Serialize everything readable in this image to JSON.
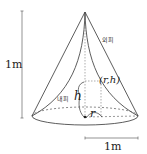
{
  "diagram": {
    "labels": {
      "height_dimension": "1m",
      "width_dimension": "1m",
      "outer_shell": "외피",
      "inner_shell": "내피",
      "point": "(r,h)",
      "h_var": "h",
      "r_var": "r"
    },
    "colors": {
      "line": "#333333",
      "dashed": "#555555",
      "dimension": "#666666"
    }
  }
}
